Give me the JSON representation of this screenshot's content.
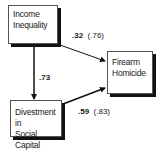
{
  "diagram": {
    "nodes": [
      {
        "id": "income_inequality",
        "lines": [
          "Income",
          "Inequality"
        ]
      },
      {
        "id": "firearm_homicide",
        "lines": [
          "Firearm",
          "Homicide"
        ]
      },
      {
        "id": "divestment",
        "lines": [
          "Divestment in",
          "Social Capital"
        ]
      }
    ],
    "edges": [
      {
        "from": "income_inequality",
        "to": "firearm_homicide",
        "coef": ".32",
        "paren": "(.76)"
      },
      {
        "from": "income_inequality",
        "to": "divestment",
        "coef": ".73",
        "paren": ""
      },
      {
        "from": "divestment",
        "to": "firearm_homicide",
        "coef": ".59",
        "paren": "(.83)"
      }
    ]
  }
}
